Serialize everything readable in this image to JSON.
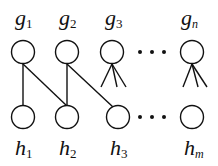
{
  "diagram": {
    "type": "bipartite-graph",
    "stroke_color": "#111111",
    "background": "#ffffff",
    "top_nodes": [
      {
        "id": "g1",
        "base": "g",
        "sub": "1",
        "cx": 23,
        "cy": 52
      },
      {
        "id": "g2",
        "base": "g",
        "sub": "2",
        "cx": 67,
        "cy": 52
      },
      {
        "id": "g3",
        "base": "g",
        "sub": "3",
        "cx": 112,
        "cy": 52
      },
      {
        "id": "gn",
        "base": "g",
        "sub": "n",
        "cx": 192,
        "cy": 52
      }
    ],
    "bottom_nodes": [
      {
        "id": "h1",
        "base": "h",
        "sub": "1",
        "cx": 23,
        "cy": 117
      },
      {
        "id": "h2",
        "base": "h",
        "sub": "2",
        "cx": 67,
        "cy": 117
      },
      {
        "id": "h3",
        "base": "h",
        "sub": "3",
        "cx": 118,
        "cy": 117
      },
      {
        "id": "hm",
        "base": "h",
        "sub": "m",
        "cx": 192,
        "cy": 117
      }
    ],
    "edges": [
      {
        "from": "g1",
        "to": "h1"
      },
      {
        "from": "g1",
        "to": "h2"
      },
      {
        "from": "g2",
        "to": "h2"
      },
      {
        "from": "g2",
        "to": "h3"
      }
    ],
    "fans": [
      {
        "from": "g3",
        "description": "three edges to unspecified nodes"
      },
      {
        "from": "gn",
        "description": "three edges to unspecified nodes"
      }
    ],
    "ellipsis_top": "• • •",
    "ellipsis_bottom": "• • •"
  }
}
